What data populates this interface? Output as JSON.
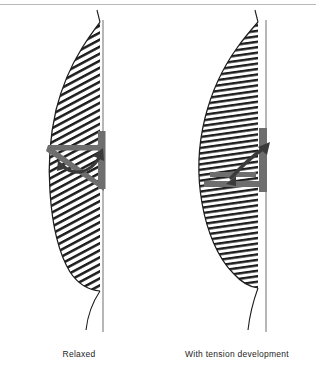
{
  "figure": {
    "type": "anatomical-diagram",
    "panel_count": 2,
    "top_rule_color": "#b9b9b9",
    "ink_color": "#1d1d1d",
    "marker_color": "#6e6e6e",
    "arrow_color": "#3a3a3a",
    "background_color": "#ffffff"
  },
  "panels": [
    {
      "id": "relaxed",
      "caption": "Relaxed",
      "hatch": {
        "style": "diagonal",
        "angle_deg": 28,
        "line_count": 54,
        "description": "long oblique muscle fibers running up-and-right at a shallow angle"
      },
      "body": {
        "description": "tall narrow lens-shaped muscle belly, apex high, tapering tail at bottom",
        "top_y": 22,
        "bottom_y": 290,
        "max_width_x": 46,
        "midline_x": 100
      },
      "angle_marker": {
        "shape": "acute-V",
        "vertex_x": 66,
        "vertex_y": 171,
        "horizontal_arm_label": "fiber-axis-arm",
        "vertical_bar_label": "tendon-bar",
        "angle_description": "narrow acute pennation angle"
      },
      "arrow": {
        "shape": "curved",
        "direction": "clockwise-to-upper-right",
        "label": "pennation-angle-arrow"
      }
    },
    {
      "id": "with-tension-development",
      "caption": "With tension development",
      "hatch": {
        "style": "near-horizontal",
        "angle_deg": 8,
        "line_count": 60,
        "description": "shortened fibers rotated toward horizontal as the muscle bulges"
      },
      "body": {
        "description": "shorter, wider and rounder muscle belly, bulging laterally, tapering tail at bottom",
        "top_y": 22,
        "bottom_y": 286,
        "max_width_x": 38,
        "midline_x": 100
      },
      "angle_marker": {
        "shape": "right-angle-L",
        "vertex_x": 66,
        "vertex_y": 183,
        "horizontal_arm_label": "fiber-axis-arm",
        "vertical_bar_label": "tendon-bar",
        "angle_description": "wide, nearly right pennation angle"
      },
      "arrow": {
        "shape": "curved",
        "direction": "clockwise-to-upper-right",
        "label": "pennation-angle-arrow"
      }
    }
  ]
}
